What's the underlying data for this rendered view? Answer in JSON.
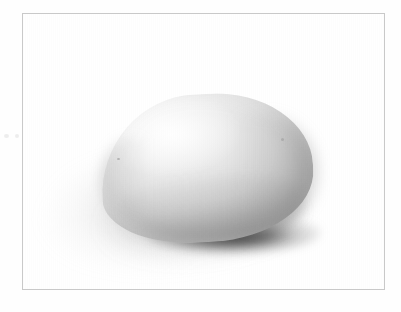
{
  "image": {
    "kind": "scanned-photograph",
    "caption": "Pale ovoid teardrop-shaped object resting on a flat white surface",
    "subject_name": "ovoid-object",
    "orientation": "narrow tip at left, rounded bulb at right",
    "lighting": "soft diffuse light from upper left",
    "background_color": "#ffffff",
    "frame_color": "#c9c9c9",
    "object_light_tone": "#fbfbfb",
    "object_mid_tone": "#d6d6d6",
    "object_dark_tone": "#a6a6a6",
    "contact_shadow_color": "#1c1c1c",
    "cast_shadow_color": "#787878",
    "shadow_direction": "lower-left"
  },
  "frame": {
    "label": "photo border rule",
    "left": 22,
    "top": 13,
    "width": 363,
    "height": 277,
    "border_width": 1
  },
  "margin_marks": [
    {
      "name": "speck-left-outer"
    },
    {
      "name": "speck-left-inner"
    }
  ],
  "object": {
    "label": "ovoid object",
    "left": 78,
    "top": 80,
    "width": 212,
    "height": 148,
    "blemishes": [
      {
        "name": "stem-scar-left"
      },
      {
        "name": "surface-mark-right"
      }
    ]
  }
}
